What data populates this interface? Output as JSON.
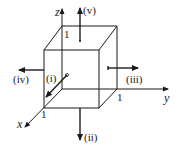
{
  "axes": {
    "x": {
      "label": "x",
      "tick": "1"
    },
    "y": {
      "label": "y",
      "tick": "1"
    },
    "z": {
      "label": "z",
      "tick": "1"
    }
  },
  "faces": {
    "i": {
      "label": "(i)",
      "direction": "+x"
    },
    "ii": {
      "label": "(ii)",
      "direction": "-z"
    },
    "iii": {
      "label": "(iii)",
      "direction": "+y"
    },
    "iv": {
      "label": "(iv)",
      "direction": "-y"
    },
    "v": {
      "label": "(v)",
      "direction": "+z"
    }
  },
  "colors": {
    "ink": "#1a1a1a",
    "background": "#ffffff"
  }
}
